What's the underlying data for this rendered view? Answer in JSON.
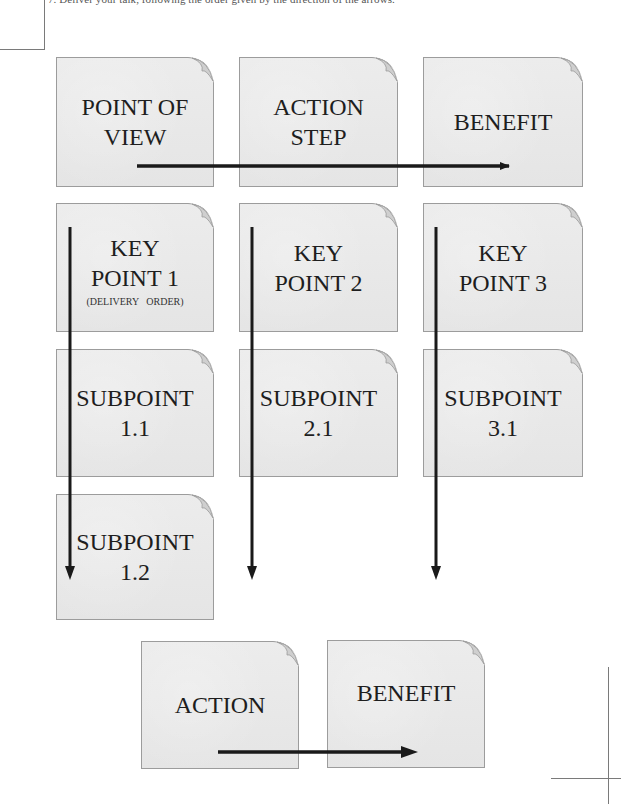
{
  "instruction_text": "7. Deliver your talk, following the order given by the direction of the arrows.",
  "cards": {
    "point_of_view": {
      "label": "POINT OF\nVIEW"
    },
    "action_step": {
      "label": "ACTION\nSTEP"
    },
    "benefit_top": {
      "label": "BENEFIT"
    },
    "key_point_1": {
      "label": "KEY\nPOINT 1",
      "note": "(DELIVERY ORDER)"
    },
    "key_point_2": {
      "label": "KEY\nPOINT 2"
    },
    "key_point_3": {
      "label": "KEY\nPOINT 3"
    },
    "subpoint_1_1": {
      "label": "SUBPOINT\n1.1"
    },
    "subpoint_2_1": {
      "label": "SUBPOINT\n2.1"
    },
    "subpoint_3_1": {
      "label": "SUBPOINT\n3.1"
    },
    "subpoint_1_2": {
      "label": "SUBPOINT\n1.2"
    },
    "action_bottom": {
      "label": "ACTION"
    },
    "benefit_bottom": {
      "label": "BENEFIT"
    }
  },
  "arrows": [
    {
      "name": "arrow-intro-flow",
      "direction": "right",
      "from": "point_of_view",
      "to": "benefit_top"
    },
    {
      "name": "arrow-key-point-1-flow",
      "direction": "down",
      "from": "key_point_1",
      "to": "subpoint_1_2"
    },
    {
      "name": "arrow-key-point-2-flow",
      "direction": "down",
      "from": "key_point_2",
      "to": "subpoint_2_1"
    },
    {
      "name": "arrow-key-point-3-flow",
      "direction": "down",
      "from": "key_point_3",
      "to": "subpoint_3_1"
    },
    {
      "name": "arrow-conclusion-flow",
      "direction": "right",
      "from": "action_bottom",
      "to": "benefit_bottom"
    }
  ],
  "colors": {
    "card_fill": "#e9e9e9",
    "card_border": "#9c9c9c",
    "arrow": "#1a1a1a",
    "text": "#1e1e1e"
  }
}
